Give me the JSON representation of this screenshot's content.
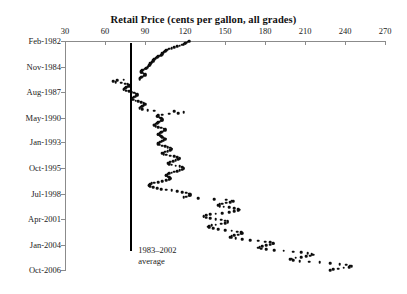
{
  "chart_data": {
    "type": "scatter",
    "title": "Retail Price (cents per gallon, all grades)",
    "xlabel": "Retail Price (cents per gallon, all grades)",
    "ylabel": "",
    "orientation": "horizontal-time",
    "xlim": [
      30,
      270
    ],
    "xticks": [
      30,
      60,
      90,
      120,
      150,
      180,
      210,
      240,
      270
    ],
    "ylim_months": [
      0,
      297
    ],
    "yticks": [
      0,
      33,
      66,
      99,
      131,
      164,
      197,
      230,
      263,
      296
    ],
    "ytick_labels": [
      "Feb-1982",
      "Nov-1984",
      "Aug-1987",
      "May-1990",
      "Jan-1993",
      "Oct-1995",
      "Jul-1998",
      "Apr-2001",
      "Jan-2004",
      "Oct-2006"
    ],
    "grid": false,
    "legend": false,
    "marker_color": "#0d0d0d",
    "axis_color": "#8b8b8b",
    "reference_line": {
      "label": "1983–2002\naverage",
      "value": 79,
      "color": "#000000",
      "orientation": "vertical"
    },
    "points": [
      [
        0,
        123
      ],
      [
        1,
        122
      ],
      [
        2,
        121
      ],
      [
        3,
        120
      ],
      [
        4,
        119
      ],
      [
        5,
        118
      ],
      [
        6,
        116
      ],
      [
        7,
        114
      ],
      [
        8,
        112
      ],
      [
        9,
        110
      ],
      [
        10,
        108
      ],
      [
        11,
        107
      ],
      [
        12,
        106
      ],
      [
        13,
        105
      ],
      [
        14,
        104
      ],
      [
        15,
        104
      ],
      [
        16,
        103
      ],
      [
        17,
        103
      ],
      [
        18,
        102
      ],
      [
        19,
        101
      ],
      [
        20,
        100
      ],
      [
        21,
        99
      ],
      [
        22,
        98
      ],
      [
        23,
        97
      ],
      [
        24,
        97
      ],
      [
        25,
        96
      ],
      [
        26,
        96
      ],
      [
        27,
        95
      ],
      [
        28,
        95
      ],
      [
        29,
        94
      ],
      [
        30,
        94
      ],
      [
        31,
        93
      ],
      [
        32,
        93
      ],
      [
        33,
        92
      ],
      [
        34,
        92
      ],
      [
        35,
        91
      ],
      [
        36,
        90
      ],
      [
        37,
        89
      ],
      [
        38,
        88
      ],
      [
        39,
        87
      ],
      [
        40,
        87
      ],
      [
        41,
        88
      ],
      [
        42,
        89
      ],
      [
        43,
        90
      ],
      [
        44,
        90
      ],
      [
        45,
        89
      ],
      [
        46,
        88
      ],
      [
        47,
        87
      ],
      [
        48,
        86
      ],
      [
        49,
        86
      ],
      [
        50,
        74
      ],
      [
        51,
        69
      ],
      [
        52,
        66
      ],
      [
        53,
        68
      ],
      [
        54,
        72
      ],
      [
        55,
        75
      ],
      [
        56,
        77
      ],
      [
        57,
        78
      ],
      [
        58,
        78
      ],
      [
        59,
        77
      ],
      [
        60,
        76
      ],
      [
        61,
        75
      ],
      [
        62,
        74
      ],
      [
        63,
        74
      ],
      [
        64,
        76
      ],
      [
        65,
        78
      ],
      [
        66,
        80
      ],
      [
        67,
        82
      ],
      [
        68,
        83
      ],
      [
        69,
        84
      ],
      [
        70,
        84
      ],
      [
        71,
        83
      ],
      [
        72,
        82
      ],
      [
        73,
        81
      ],
      [
        74,
        80
      ],
      [
        75,
        80
      ],
      [
        76,
        81
      ],
      [
        77,
        83
      ],
      [
        78,
        85
      ],
      [
        79,
        87
      ],
      [
        80,
        89
      ],
      [
        81,
        90
      ],
      [
        82,
        90
      ],
      [
        83,
        89
      ],
      [
        84,
        88
      ],
      [
        85,
        87
      ],
      [
        86,
        86
      ],
      [
        87,
        86
      ],
      [
        88,
        88
      ],
      [
        89,
        92
      ],
      [
        90,
        97
      ],
      [
        91,
        112
      ],
      [
        92,
        119
      ],
      [
        93,
        115
      ],
      [
        94,
        108
      ],
      [
        95,
        103
      ],
      [
        96,
        100
      ],
      [
        97,
        99
      ],
      [
        98,
        100
      ],
      [
        99,
        101
      ],
      [
        100,
        102
      ],
      [
        101,
        103
      ],
      [
        102,
        103
      ],
      [
        103,
        102
      ],
      [
        104,
        101
      ],
      [
        105,
        100
      ],
      [
        106,
        99
      ],
      [
        107,
        98
      ],
      [
        108,
        97
      ],
      [
        109,
        97
      ],
      [
        110,
        98
      ],
      [
        111,
        100
      ],
      [
        112,
        102
      ],
      [
        113,
        104
      ],
      [
        114,
        105
      ],
      [
        115,
        105
      ],
      [
        116,
        104
      ],
      [
        117,
        103
      ],
      [
        118,
        102
      ],
      [
        119,
        101
      ],
      [
        120,
        100
      ],
      [
        121,
        100
      ],
      [
        122,
        101
      ],
      [
        123,
        102
      ],
      [
        124,
        103
      ],
      [
        125,
        104
      ],
      [
        126,
        105
      ],
      [
        127,
        105
      ],
      [
        128,
        104
      ],
      [
        129,
        103
      ],
      [
        130,
        102
      ],
      [
        131,
        101
      ],
      [
        132,
        100
      ],
      [
        133,
        100
      ],
      [
        134,
        101
      ],
      [
        135,
        103
      ],
      [
        136,
        105
      ],
      [
        137,
        107
      ],
      [
        138,
        109
      ],
      [
        139,
        110
      ],
      [
        140,
        110
      ],
      [
        141,
        109
      ],
      [
        142,
        107
      ],
      [
        143,
        105
      ],
      [
        144,
        104
      ],
      [
        145,
        103
      ],
      [
        146,
        104
      ],
      [
        147,
        106
      ],
      [
        148,
        109
      ],
      [
        149,
        112
      ],
      [
        150,
        114
      ],
      [
        151,
        116
      ],
      [
        152,
        116
      ],
      [
        153,
        115
      ],
      [
        154,
        113
      ],
      [
        155,
        111
      ],
      [
        156,
        109
      ],
      [
        157,
        108
      ],
      [
        158,
        107
      ],
      [
        159,
        108
      ],
      [
        160,
        110
      ],
      [
        161,
        113
      ],
      [
        162,
        116
      ],
      [
        163,
        118
      ],
      [
        164,
        119
      ],
      [
        165,
        119
      ],
      [
        166,
        118
      ],
      [
        167,
        116
      ],
      [
        168,
        114
      ],
      [
        169,
        112
      ],
      [
        170,
        110
      ],
      [
        171,
        108
      ],
      [
        172,
        107
      ],
      [
        173,
        106
      ],
      [
        174,
        106
      ],
      [
        175,
        107
      ],
      [
        176,
        108
      ],
      [
        177,
        109
      ],
      [
        178,
        109
      ],
      [
        179,
        108
      ],
      [
        180,
        106
      ],
      [
        181,
        103
      ],
      [
        182,
        100
      ],
      [
        183,
        97
      ],
      [
        184,
        95
      ],
      [
        185,
        94
      ],
      [
        186,
        93
      ],
      [
        187,
        93
      ],
      [
        188,
        94
      ],
      [
        189,
        96
      ],
      [
        190,
        99
      ],
      [
        191,
        102
      ],
      [
        192,
        106
      ],
      [
        193,
        110
      ],
      [
        194,
        114
      ],
      [
        195,
        118
      ],
      [
        196,
        121
      ],
      [
        197,
        123
      ],
      [
        198,
        124
      ],
      [
        199,
        124
      ],
      [
        200,
        123
      ],
      [
        201,
        121
      ],
      [
        202,
        119
      ],
      [
        203,
        130
      ],
      [
        204,
        142
      ],
      [
        205,
        151
      ],
      [
        206,
        155
      ],
      [
        207,
        156
      ],
      [
        208,
        154
      ],
      [
        209,
        151
      ],
      [
        210,
        148
      ],
      [
        211,
        146
      ],
      [
        212,
        145
      ],
      [
        213,
        146
      ],
      [
        214,
        149
      ],
      [
        215,
        153
      ],
      [
        216,
        157
      ],
      [
        217,
        160
      ],
      [
        218,
        161
      ],
      [
        219,
        160
      ],
      [
        220,
        157
      ],
      [
        221,
        153
      ],
      [
        222,
        148
      ],
      [
        223,
        143
      ],
      [
        224,
        139
      ],
      [
        225,
        136
      ],
      [
        226,
        134
      ],
      [
        227,
        134
      ],
      [
        228,
        136
      ],
      [
        229,
        139
      ],
      [
        230,
        143
      ],
      [
        231,
        147
      ],
      [
        232,
        150
      ],
      [
        233,
        152
      ],
      [
        234,
        152
      ],
      [
        235,
        150
      ],
      [
        236,
        147
      ],
      [
        237,
        143
      ],
      [
        238,
        140
      ],
      [
        239,
        138
      ],
      [
        240,
        137
      ],
      [
        241,
        138
      ],
      [
        242,
        141
      ],
      [
        243,
        145
      ],
      [
        244,
        150
      ],
      [
        245,
        155
      ],
      [
        246,
        159
      ],
      [
        247,
        162
      ],
      [
        248,
        163
      ],
      [
        249,
        162
      ],
      [
        250,
        160
      ],
      [
        251,
        157
      ],
      [
        252,
        155
      ],
      [
        253,
        154
      ],
      [
        254,
        155
      ],
      [
        255,
        158
      ],
      [
        256,
        163
      ],
      [
        257,
        169
      ],
      [
        258,
        175
      ],
      [
        259,
        180
      ],
      [
        260,
        184
      ],
      [
        261,
        186
      ],
      [
        262,
        186
      ],
      [
        263,
        184
      ],
      [
        264,
        181
      ],
      [
        265,
        178
      ],
      [
        266,
        176
      ],
      [
        267,
        175
      ],
      [
        268,
        177
      ],
      [
        269,
        181
      ],
      [
        270,
        187
      ],
      [
        271,
        194
      ],
      [
        272,
        201
      ],
      [
        273,
        207
      ],
      [
        274,
        212
      ],
      [
        275,
        215
      ],
      [
        276,
        216
      ],
      [
        277,
        214
      ],
      [
        278,
        211
      ],
      [
        279,
        207
      ],
      [
        280,
        203
      ],
      [
        281,
        200
      ],
      [
        282,
        199
      ],
      [
        283,
        201
      ],
      [
        284,
        206
      ],
      [
        285,
        213
      ],
      [
        286,
        221
      ],
      [
        287,
        229
      ],
      [
        288,
        236
      ],
      [
        289,
        241
      ],
      [
        290,
        244
      ],
      [
        291,
        245
      ],
      [
        292,
        243
      ],
      [
        293,
        239
      ],
      [
        294,
        235
      ],
      [
        295,
        231
      ],
      [
        296,
        229
      ]
    ]
  }
}
